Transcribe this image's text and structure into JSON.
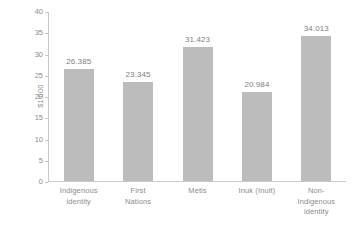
{
  "chart_data": {
    "type": "bar",
    "title": "",
    "subtitle": "",
    "xlabel": "",
    "ylabel": "$1'000",
    "categories": [
      "Indigenous identity",
      "First Nations",
      "Métis",
      "Inuk (Inuit)",
      "Non-Indigenous identity"
    ],
    "values": [
      26.385,
      23.345,
      31.423,
      20.984,
      34.013
    ],
    "value_labels": [
      "26.385",
      "23.345",
      "31.423",
      "20.984",
      "34.013"
    ],
    "ylim": [
      0,
      40
    ],
    "ytick_values": [
      0,
      5,
      10,
      15,
      20,
      25,
      30,
      35,
      40
    ],
    "ytick_labels": [
      "0",
      "5",
      "10",
      "15",
      "20",
      "25",
      "30",
      "35",
      "40"
    ],
    "grid": false,
    "legend": null,
    "legend_position": "none",
    "bar_color": "#bcbcbc",
    "axis_color": "#c9c9c9",
    "text_color": "#8d8d8d",
    "background_color": "#ffffff"
  },
  "axis": {
    "y_title": "$1'000"
  },
  "categories_wrapped": [
    [
      "Indigenous",
      "identity"
    ],
    [
      "First",
      "Nations"
    ],
    [
      "Métis"
    ],
    [
      "Inuk (Inuit)"
    ],
    [
      "Non-",
      "Indigenous",
      "identity"
    ]
  ]
}
